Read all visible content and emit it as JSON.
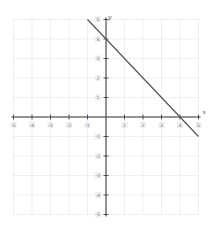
{
  "chart_data": {
    "type": "line",
    "title": "",
    "xlabel": "x",
    "ylabel": "y",
    "xlim": [
      -5,
      5
    ],
    "ylim": [
      -5,
      5
    ],
    "grid": true,
    "x_ticks": [
      -5,
      -4,
      -3,
      -2,
      -1,
      1,
      2,
      3,
      4,
      5
    ],
    "y_ticks": [
      5,
      4,
      3,
      2,
      1,
      -1,
      -2,
      -3,
      -4,
      -5
    ],
    "series": [
      {
        "name": "y = -x + 4",
        "x": [
          -1,
          5
        ],
        "y": [
          5,
          -1
        ],
        "color": "#555555"
      }
    ],
    "annotations": {
      "y_intercept": [
        0,
        4
      ],
      "x_intercept": [
        4,
        0
      ]
    }
  },
  "layout": {
    "origin_px": [
      106,
      117
    ],
    "unit_x_px": 18.5,
    "unit_y_px": 19.5,
    "colors": {
      "axis": "#333333",
      "grid": "#e8e8e8",
      "line": "#555555",
      "label_bg": "#eeeeee",
      "label_text": "#777777"
    }
  },
  "labels": {
    "x_axis_name": "x",
    "y_axis_name": "y"
  }
}
